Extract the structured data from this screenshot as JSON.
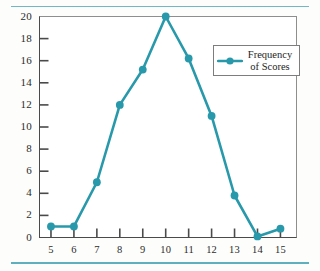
{
  "chart_data": {
    "type": "line",
    "title": "",
    "subtitle": "",
    "xlabel": "",
    "ylabel": "",
    "x": [
      5,
      6,
      7,
      8,
      9,
      10,
      11,
      12,
      13,
      14,
      15
    ],
    "values": [
      1,
      1,
      5,
      12,
      15.2,
      20,
      16.2,
      11,
      3.8,
      0.1,
      0.8
    ],
    "series": [
      {
        "name": "Frequency of Scores",
        "values": [
          1,
          1,
          5,
          12,
          15.2,
          20,
          16.2,
          11,
          3.8,
          0.1,
          0.8
        ]
      }
    ],
    "xlim": [
      4.5,
      15.7
    ],
    "ylim": [
      0,
      20
    ],
    "xticks": [
      5,
      6,
      7,
      8,
      9,
      10,
      11,
      12,
      13,
      14,
      15
    ],
    "xtick_labels": [
      "5",
      "6",
      "7",
      "8",
      "9",
      "10",
      "11",
      "12",
      "13",
      "14",
      "15"
    ],
    "yticks": [
      0,
      2,
      4,
      6,
      8,
      10,
      12,
      14,
      16,
      18,
      20
    ],
    "ytick_labels": [
      "0",
      "2",
      "4",
      "6",
      "8",
      "10",
      "12",
      "14",
      "16",
      "18",
      "20"
    ],
    "grid": false,
    "marker": "circle",
    "legend_position": "upper right",
    "series_color": "#2899ab",
    "axis_color": "#4a4a4a",
    "frame_color": "#8e8e8e",
    "rule_color": "#6fb8c4"
  },
  "legend": {
    "label_line1": "Frequency",
    "label_line2": "of Scores",
    "sample_name": "line-with-marker-sample"
  }
}
